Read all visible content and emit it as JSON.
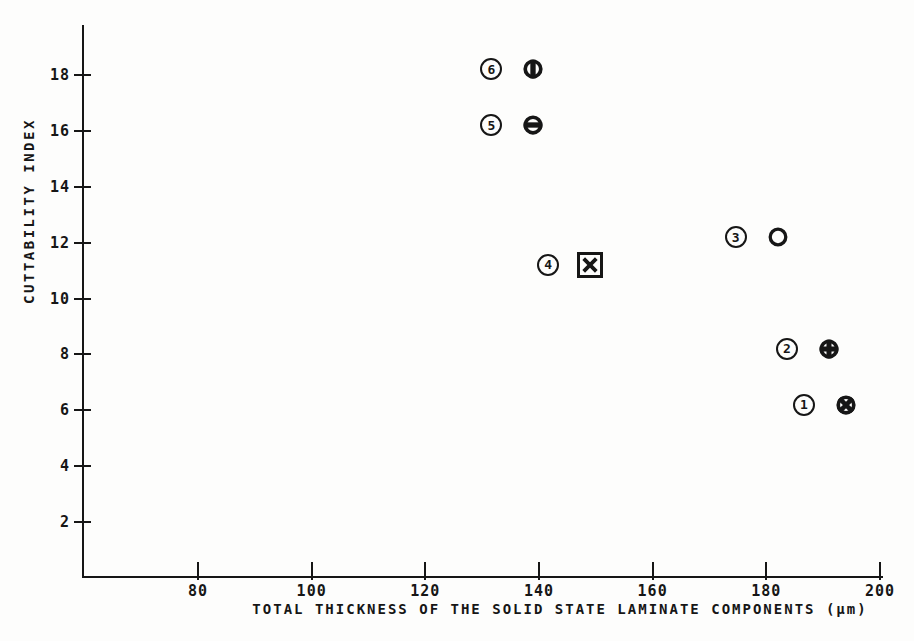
{
  "figure": {
    "background_color": "#fdfdfc",
    "ink_color": "#161616"
  },
  "chart_data": {
    "type": "scatter",
    "title": "",
    "xlabel": "TOTAL THICKNESS OF THE SOLID STATE LAMINATE COMPONENTS (μm)",
    "ylabel": "CUTTABILITY INDEX",
    "xlim": [
      60,
      200.5
    ],
    "ylim": [
      0,
      19.8
    ],
    "x_ticks": [
      80,
      100,
      120,
      140,
      160,
      180,
      200
    ],
    "y_ticks": [
      2,
      4,
      6,
      8,
      10,
      12,
      14,
      16,
      18
    ],
    "grid": false,
    "legend": "none",
    "points": [
      {
        "label": "6",
        "x": 139,
        "y": 18.2,
        "marker": "circle-vertical-bar"
      },
      {
        "label": "5",
        "x": 139,
        "y": 16.2,
        "marker": "circle-horizontal-bar"
      },
      {
        "label": "3",
        "x": 182,
        "y": 12.2,
        "marker": "open-circle"
      },
      {
        "label": "4",
        "x": 149,
        "y": 11.2,
        "marker": "square-x"
      },
      {
        "label": "2",
        "x": 191,
        "y": 8.2,
        "marker": "circle-plus"
      },
      {
        "label": "1",
        "x": 194,
        "y": 6.2,
        "marker": "circle-x"
      }
    ]
  }
}
